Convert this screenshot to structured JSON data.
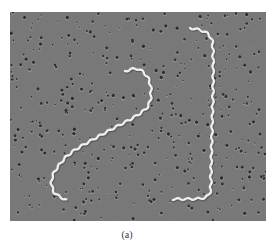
{
  "figure": {
    "caption": "(a)",
    "colors": {
      "background": "#7b7b7b",
      "pores": "#2e2e2e",
      "organism": "#e8e8e8"
    },
    "organisms": [
      {
        "name": "left-spirochete",
        "points": [
          [
            115,
            59
          ],
          [
            128,
            57
          ],
          [
            138,
            66
          ],
          [
            141,
            80
          ],
          [
            138,
            94
          ],
          [
            126,
            104
          ],
          [
            104,
            116
          ],
          [
            82,
            128
          ],
          [
            62,
            140
          ],
          [
            50,
            152
          ],
          [
            42,
            166
          ],
          [
            44,
            180
          ],
          [
            56,
            188
          ]
        ]
      },
      {
        "name": "right-spirochete",
        "points": [
          [
            180,
            16
          ],
          [
            193,
            19
          ],
          [
            201,
            26
          ],
          [
            203,
            40
          ],
          [
            203,
            80
          ],
          [
            202,
            120
          ],
          [
            201,
            160
          ],
          [
            200,
            180
          ],
          [
            193,
            186
          ],
          [
            176,
            187
          ],
          [
            163,
            187
          ]
        ]
      }
    ]
  }
}
